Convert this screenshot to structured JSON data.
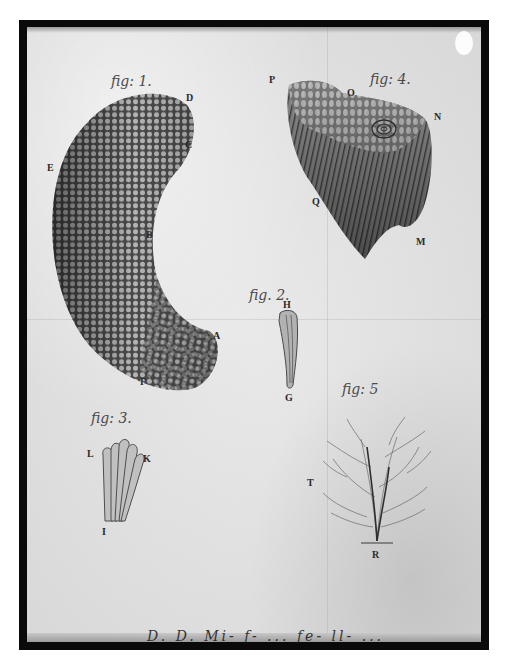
{
  "plate": {
    "description": "Antique engraved scientific plate with five numbered figures",
    "frame_color": "#0a0a0a",
    "paper_color": "#e2e2e2",
    "ink_color": "#3a3a3a"
  },
  "figures": [
    {
      "id": "fig1",
      "label": "fig: 1.",
      "letters": [
        "D",
        "C",
        "E",
        "B",
        "A",
        "F"
      ],
      "subject": "curved honeycomb-textured body"
    },
    {
      "id": "fig2",
      "label": "fig. 2.",
      "letters": [
        "H",
        "G"
      ],
      "subject": "slender tubular element"
    },
    {
      "id": "fig3",
      "label": "fig: 3.",
      "letters": [
        "L",
        "K",
        "I"
      ],
      "subject": "bundle of fused tubes"
    },
    {
      "id": "fig4",
      "label": "fig: 4.",
      "letters": [
        "P",
        "O",
        "N",
        "Q",
        "M"
      ],
      "subject": "fan-shaped striated fragment"
    },
    {
      "id": "fig5",
      "label": "fig: 5",
      "letters": [
        "T",
        "R"
      ],
      "subject": "branching dendritic structure"
    }
  ],
  "caption": "D. D. Mi- f- ... fe- ll- ..."
}
